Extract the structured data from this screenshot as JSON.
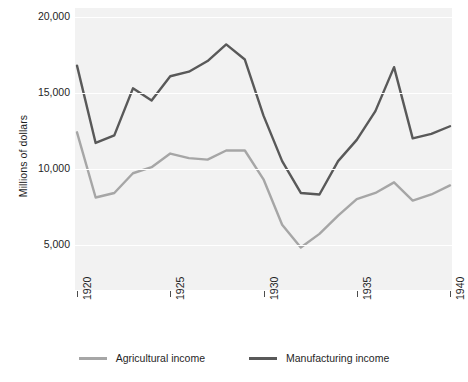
{
  "chart_data": {
    "type": "line",
    "title": "",
    "subtitle": "",
    "xlabel": "",
    "ylabel": "Millions of dollars",
    "x": [
      1920,
      1921,
      1922,
      1923,
      1924,
      1925,
      1926,
      1927,
      1928,
      1929,
      1930,
      1931,
      1932,
      1933,
      1934,
      1935,
      1936,
      1937,
      1938,
      1939,
      1940
    ],
    "xlim": [
      1920,
      1940
    ],
    "ylim": [
      2000,
      20600
    ],
    "xticks": [
      1920,
      1925,
      1930,
      1935,
      1940
    ],
    "xtick_labels": [
      "1920",
      "1925",
      "1930",
      "1935",
      "1940"
    ],
    "yticks": [
      5000,
      10000,
      15000,
      20000
    ],
    "ytick_labels": [
      "5,000",
      "10,000",
      "15,000",
      "20,000"
    ],
    "grid": "horizontal",
    "grid_color": "#ffffff",
    "plot_background": "#f2f2f2",
    "legend_position": "bottom",
    "series": [
      {
        "name": "Agricultural income",
        "color": "#a6a6a6",
        "values": [
          12400,
          8100,
          8400,
          9700,
          10100,
          11000,
          10700,
          10600,
          11200,
          11200,
          9300,
          6300,
          4800,
          5700,
          6900,
          8000,
          8400,
          9100,
          7900,
          8300,
          8900
        ]
      },
      {
        "name": "Manufacturing income",
        "color": "#595959",
        "values": [
          16800,
          11700,
          12200,
          15300,
          14500,
          16100,
          16400,
          17100,
          18200,
          17200,
          13500,
          10500,
          8400,
          8300,
          10500,
          11900,
          13800,
          16700,
          12000,
          12300,
          12800
        ]
      }
    ]
  },
  "legend": {
    "items": [
      {
        "label": "Agricultural income",
        "color": "#a6a6a6"
      },
      {
        "label": "Manufacturing income",
        "color": "#595959"
      }
    ]
  },
  "axes": {
    "y_title": "Millions of dollars"
  }
}
